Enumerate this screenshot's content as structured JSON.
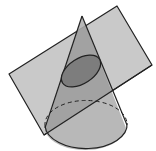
{
  "figure": {
    "width": 156,
    "height": 151,
    "colors": {
      "background": "#ffffff",
      "plane_fill": "#c8c8c8",
      "cone_fill": "#a9a9a9",
      "cone_over_plane_fill": "#9a9a9a",
      "section_fill": "#7c7c7c",
      "stroke": "#222222"
    },
    "plane": {
      "points": "9,74 117,6 152,65 44,135"
    },
    "cone": {
      "apex": [
        82,
        16
      ],
      "base_left": [
        45,
        131
      ],
      "base_right": [
        126,
        128
      ],
      "base_ellipse": {
        "cx": 86,
        "cy": 123,
        "rx": 41,
        "ry": 24
      }
    },
    "section_ellipse": {
      "cx": 81,
      "cy": 71,
      "rx": 22,
      "ry": 12.5,
      "rotate": -33
    }
  }
}
